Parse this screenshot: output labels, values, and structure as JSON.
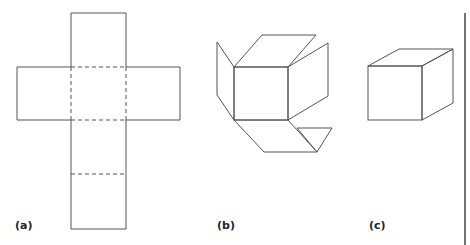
{
  "figure": {
    "panels": [
      {
        "label": "(a)",
        "description": "unfolded cube net (cross shape)"
      },
      {
        "label": "(b)",
        "description": "partially folded cube"
      },
      {
        "label": "(c)",
        "description": "assembled cube"
      }
    ],
    "stroke_color": "#555555",
    "background": "#ffffff"
  }
}
